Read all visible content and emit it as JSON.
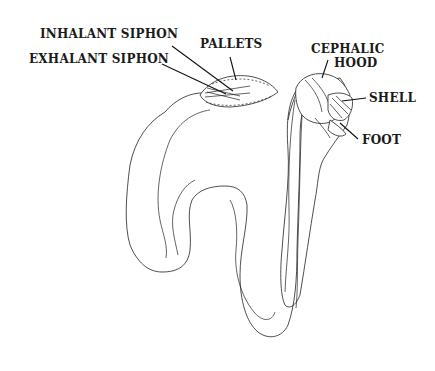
{
  "figure": {
    "labels": {
      "inhalant_siphon": "INHALANT SIPHON",
      "exhalant_siphon": "EXHALANT SIPHON",
      "pallets": "PALLETS",
      "cephalic_hood_line1": "CEPHALIC",
      "cephalic_hood_line2": "HOOD",
      "shell": "SHELL",
      "foot": "FOOT"
    },
    "colors": {
      "line": "#222222",
      "background": "#ffffff",
      "text": "#1a1a1a"
    }
  }
}
